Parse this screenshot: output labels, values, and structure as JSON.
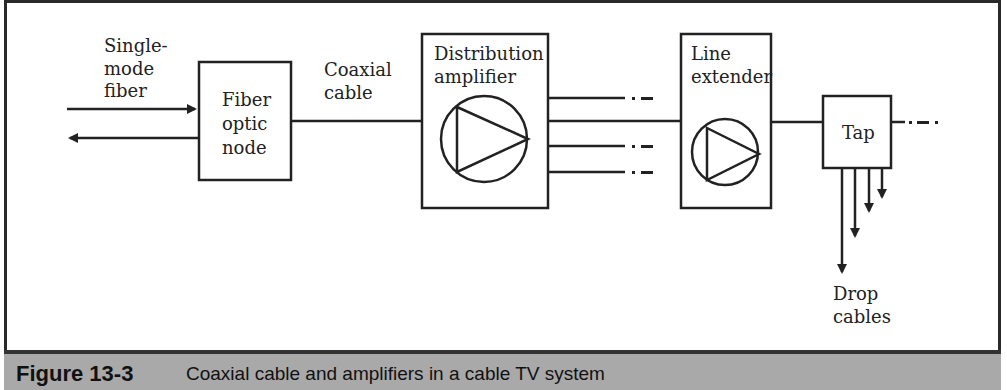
{
  "diagram": {
    "input_label": [
      "Single-",
      "mode",
      "fiber"
    ],
    "fiber_node": [
      "Fiber",
      "optic",
      "node"
    ],
    "coax_label": [
      "Coaxial",
      "cable"
    ],
    "distribution_amp": [
      "Distribution",
      "amplifier"
    ],
    "line_extender": [
      "Line",
      "extender"
    ],
    "tap": "Tap",
    "drop_cables": [
      "Drop",
      "cables"
    ]
  },
  "caption": {
    "label": "Figure 13-3",
    "text": "Coaxial cable and amplifiers in a cable TV system"
  },
  "colors": {
    "stroke": "#222222",
    "caption_bg": "#a9a9a9",
    "caption_border": "#333333"
  }
}
